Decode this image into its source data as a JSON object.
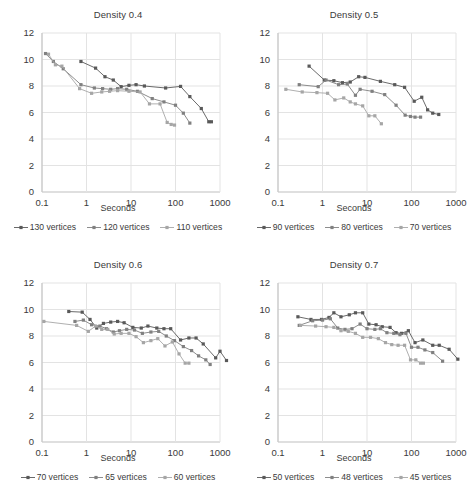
{
  "figure": {
    "axis_label": "Seconds",
    "ylim": [
      0,
      12
    ],
    "yticks": [
      0,
      2,
      4,
      6,
      8,
      10,
      12
    ],
    "xticks": [
      0.1,
      1,
      10,
      100,
      1000
    ],
    "xtick_labels": [
      "0.1",
      "1",
      "10",
      "100",
      "1000"
    ],
    "xscale": "log",
    "xlim": [
      0.1,
      1000
    ],
    "grid": true,
    "colors": {
      "series_dark": "#595959",
      "series_mid": "#808080",
      "series_light": "#A6A6A6",
      "gridline": "#E3E3E3",
      "axis": "#BFBFBF",
      "text": "#3A3A3A"
    }
  },
  "chart_data": [
    {
      "type": "line",
      "title": "Density 0.4",
      "xlabel": "Seconds",
      "ylabel": "",
      "xscale": "log",
      "xlim": [
        0.1,
        1000
      ],
      "ylim": [
        0,
        12
      ],
      "grid": true,
      "legend_position": "bottom",
      "series": [
        {
          "name": "130 vertices",
          "color": "#595959",
          "points": [
            [
              0.75,
              9.85
            ],
            [
              1.6,
              9.35
            ],
            [
              2.6,
              8.7
            ],
            [
              4.0,
              8.45
            ],
            [
              6.0,
              7.95
            ],
            [
              9.0,
              8.05
            ],
            [
              13.0,
              8.1
            ],
            [
              20.0,
              8.0
            ],
            [
              60.0,
              7.85
            ],
            [
              130.0,
              7.97
            ],
            [
              210.0,
              7.2
            ],
            [
              380.0,
              6.3
            ],
            [
              560.0,
              5.3
            ],
            [
              640.0,
              5.3
            ]
          ]
        },
        {
          "name": "120 vertices",
          "color": "#808080",
          "points": [
            [
              0.12,
              10.45
            ],
            [
              0.18,
              9.85
            ],
            [
              0.3,
              9.3
            ],
            [
              0.75,
              8.1
            ],
            [
              1.5,
              7.85
            ],
            [
              2.3,
              7.8
            ],
            [
              3.5,
              7.75
            ],
            [
              5.0,
              7.8
            ],
            [
              8.0,
              7.75
            ],
            [
              14.0,
              7.6
            ],
            [
              30.0,
              7.05
            ],
            [
              55.0,
              6.8
            ],
            [
              100.0,
              6.55
            ],
            [
              150.0,
              5.95
            ],
            [
              210.0,
              5.2
            ]
          ]
        },
        {
          "name": "110 vertices",
          "color": "#A6A6A6",
          "points": [
            [
              0.14,
              10.4
            ],
            [
              0.2,
              9.6
            ],
            [
              0.28,
              9.5
            ],
            [
              0.7,
              7.8
            ],
            [
              1.3,
              7.45
            ],
            [
              2.2,
              7.55
            ],
            [
              3.3,
              7.6
            ],
            [
              5.0,
              7.65
            ],
            [
              9.0,
              7.6
            ],
            [
              16.0,
              7.55
            ],
            [
              26.0,
              6.65
            ],
            [
              45.0,
              6.65
            ],
            [
              65.0,
              5.25
            ],
            [
              80.0,
              5.1
            ],
            [
              95.0,
              5.05
            ]
          ]
        }
      ]
    },
    {
      "type": "line",
      "title": "Density 0.5",
      "xlabel": "Seconds",
      "ylabel": "",
      "xscale": "log",
      "xlim": [
        0.1,
        1000
      ],
      "ylim": [
        0,
        12
      ],
      "grid": true,
      "legend_position": "bottom",
      "series": [
        {
          "name": "90 vertices",
          "color": "#595959",
          "points": [
            [
              0.5,
              9.5
            ],
            [
              1.1,
              8.45
            ],
            [
              1.8,
              8.4
            ],
            [
              2.8,
              8.25
            ],
            [
              4.2,
              8.3
            ],
            [
              6.5,
              8.7
            ],
            [
              9.0,
              8.65
            ],
            [
              20.0,
              8.35
            ],
            [
              42.0,
              8.1
            ],
            [
              70.0,
              7.9
            ],
            [
              115.0,
              6.85
            ],
            [
              170.0,
              7.15
            ],
            [
              230.0,
              6.2
            ],
            [
              300.0,
              5.95
            ],
            [
              410.0,
              5.85
            ]
          ]
        },
        {
          "name": "80 vertices",
          "color": "#808080",
          "points": [
            [
              0.3,
              8.1
            ],
            [
              0.8,
              7.95
            ],
            [
              1.2,
              8.45
            ],
            [
              2.3,
              8.1
            ],
            [
              3.6,
              8.15
            ],
            [
              5.5,
              7.3
            ],
            [
              7.0,
              7.75
            ],
            [
              13.0,
              7.6
            ],
            [
              25.0,
              7.35
            ],
            [
              45.0,
              6.55
            ],
            [
              72.0,
              5.8
            ],
            [
              95.0,
              5.7
            ],
            [
              120.0,
              5.65
            ],
            [
              160.0,
              5.65
            ]
          ]
        },
        {
          "name": "70 vertices",
          "color": "#A6A6A6",
          "points": [
            [
              0.15,
              7.75
            ],
            [
              0.35,
              7.55
            ],
            [
              0.75,
              7.5
            ],
            [
              1.3,
              7.45
            ],
            [
              1.9,
              6.95
            ],
            [
              3.0,
              7.1
            ],
            [
              4.2,
              6.8
            ],
            [
              5.5,
              6.65
            ],
            [
              8.0,
              6.5
            ],
            [
              11.0,
              5.75
            ],
            [
              15.0,
              5.75
            ],
            [
              21.0,
              5.15
            ]
          ]
        }
      ]
    },
    {
      "type": "line",
      "title": "Density 0.6",
      "xlabel": "Seconds",
      "ylabel": "",
      "xscale": "log",
      "xlim": [
        0.1,
        1000
      ],
      "ylim": [
        0,
        12
      ],
      "grid": true,
      "legend_position": "bottom",
      "series": [
        {
          "name": "70 vertices",
          "color": "#595959",
          "points": [
            [
              0.4,
              9.85
            ],
            [
              0.8,
              9.8
            ],
            [
              1.2,
              9.25
            ],
            [
              1.7,
              8.6
            ],
            [
              2.4,
              8.95
            ],
            [
              3.5,
              9.05
            ],
            [
              5.0,
              9.1
            ],
            [
              7.0,
              9.0
            ],
            [
              11.0,
              8.65
            ],
            [
              17.0,
              8.6
            ],
            [
              24.0,
              8.75
            ],
            [
              38.0,
              8.6
            ],
            [
              55.0,
              8.55
            ],
            [
              78.0,
              8.55
            ],
            [
              130.0,
              7.7
            ],
            [
              200.0,
              7.85
            ],
            [
              290.0,
              7.85
            ],
            [
              420.0,
              7.4
            ],
            [
              800.0,
              6.35
            ],
            [
              1000.0,
              6.85
            ],
            [
              1400.0,
              6.15
            ]
          ]
        },
        {
          "name": "65 vertices",
          "color": "#808080",
          "points": [
            [
              0.55,
              9.1
            ],
            [
              0.85,
              9.2
            ],
            [
              1.3,
              8.85
            ],
            [
              2.0,
              8.75
            ],
            [
              2.8,
              8.55
            ],
            [
              4.0,
              8.3
            ],
            [
              5.5,
              8.4
            ],
            [
              8.0,
              8.5
            ],
            [
              12.0,
              8.45
            ],
            [
              18.0,
              8.2
            ],
            [
              28.0,
              8.3
            ],
            [
              42.0,
              8.35
            ],
            [
              62.0,
              8.0
            ],
            [
              95.0,
              7.65
            ],
            [
              150.0,
              7.2
            ],
            [
              230.0,
              6.9
            ],
            [
              330.0,
              6.5
            ],
            [
              480.0,
              6.2
            ],
            [
              600.0,
              5.85
            ]
          ]
        },
        {
          "name": "60 vertices",
          "color": "#A6A6A6",
          "points": [
            [
              0.11,
              9.1
            ],
            [
              0.6,
              8.8
            ],
            [
              1.1,
              8.35
            ],
            [
              1.6,
              8.75
            ],
            [
              2.2,
              8.5
            ],
            [
              3.0,
              8.5
            ],
            [
              4.2,
              8.15
            ],
            [
              6.0,
              8.2
            ],
            [
              9.0,
              8.2
            ],
            [
              13.0,
              7.95
            ],
            [
              19.0,
              7.5
            ],
            [
              28.0,
              7.65
            ],
            [
              40.0,
              7.8
            ],
            [
              58.0,
              7.25
            ],
            [
              85.0,
              7.55
            ],
            [
              120.0,
              6.65
            ],
            [
              165.0,
              5.95
            ],
            [
              200.0,
              5.95
            ]
          ]
        }
      ]
    },
    {
      "type": "line",
      "title": "Density 0.7",
      "xlabel": "Seconds",
      "ylabel": "",
      "xscale": "log",
      "xlim": [
        0.1,
        1000
      ],
      "ylim": [
        0,
        12
      ],
      "grid": true,
      "legend_position": "bottom",
      "series": [
        {
          "name": "50 vertices",
          "color": "#595959",
          "points": [
            [
              0.28,
              9.45
            ],
            [
              0.55,
              9.25
            ],
            [
              0.95,
              9.25
            ],
            [
              1.4,
              9.4
            ],
            [
              1.8,
              9.75
            ],
            [
              2.6,
              9.45
            ],
            [
              4.0,
              9.6
            ],
            [
              5.5,
              9.75
            ],
            [
              8.0,
              9.75
            ],
            [
              11.0,
              8.9
            ],
            [
              16.0,
              8.85
            ],
            [
              22.0,
              8.7
            ],
            [
              33.0,
              8.65
            ],
            [
              45.0,
              8.25
            ],
            [
              60.0,
              8.2
            ],
            [
              85.0,
              8.4
            ],
            [
              120.0,
              7.5
            ],
            [
              180.0,
              7.7
            ],
            [
              300.0,
              7.3
            ],
            [
              420.0,
              7.3
            ],
            [
              700.0,
              7.0
            ],
            [
              1100.0,
              6.25
            ]
          ]
        },
        {
          "name": "48 vertices",
          "color": "#808080",
          "points": [
            [
              0.3,
              8.8
            ],
            [
              0.6,
              9.15
            ],
            [
              1.0,
              9.2
            ],
            [
              1.5,
              9.3
            ],
            [
              2.2,
              8.6
            ],
            [
              3.2,
              8.5
            ],
            [
              4.6,
              8.55
            ],
            [
              7.0,
              8.9
            ],
            [
              10.0,
              8.55
            ],
            [
              15.0,
              8.5
            ],
            [
              20.0,
              8.55
            ],
            [
              28.0,
              8.25
            ],
            [
              40.0,
              8.2
            ],
            [
              55.0,
              8.1
            ],
            [
              75.0,
              8.2
            ],
            [
              100.0,
              7.15
            ],
            [
              140.0,
              7.15
            ],
            [
              200.0,
              6.95
            ],
            [
              300.0,
              6.75
            ],
            [
              500.0,
              6.1
            ]
          ]
        },
        {
          "name": "45 vertices",
          "color": "#A6A6A6",
          "points": [
            [
              0.32,
              8.8
            ],
            [
              0.7,
              8.75
            ],
            [
              1.2,
              8.7
            ],
            [
              1.8,
              8.65
            ],
            [
              2.6,
              8.4
            ],
            [
              3.8,
              8.35
            ],
            [
              5.5,
              8.2
            ],
            [
              8.0,
              7.9
            ],
            [
              12.0,
              7.9
            ],
            [
              18.0,
              7.8
            ],
            [
              26.0,
              7.5
            ],
            [
              36.0,
              7.35
            ],
            [
              50.0,
              7.3
            ],
            [
              70.0,
              7.3
            ],
            [
              95.0,
              6.2
            ],
            [
              125.0,
              6.2
            ],
            [
              160.0,
              5.95
            ],
            [
              185.0,
              5.95
            ]
          ]
        }
      ]
    }
  ]
}
